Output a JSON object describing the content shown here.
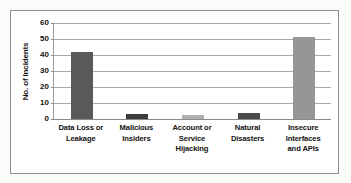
{
  "chart_data": {
    "type": "bar",
    "title": "",
    "subtitle": "",
    "xlabel": "",
    "ylabel": "No. of Incidents",
    "categories": [
      "Data Loss or Leakage",
      "Malicious Insiders",
      "Account or Service Hijacking",
      "Natural Disasters",
      "Insecure Interfaces and APIs"
    ],
    "category_lines": [
      [
        "Data Loss or",
        "Leakage"
      ],
      [
        "Malicious",
        "Insiders"
      ],
      [
        "Account or",
        "Service",
        "Hijacking"
      ],
      [
        "Natural",
        "Disasters"
      ],
      [
        "Insecure",
        "Interfaces",
        "and APIs"
      ]
    ],
    "values": [
      42,
      3,
      2.5,
      4,
      51
    ],
    "bar_colors": [
      "#595959",
      "#3b3b3b",
      "#b0b0b0",
      "#4a4a4a",
      "#969696"
    ],
    "ylim": [
      0,
      60
    ],
    "ytick_values": [
      0,
      10,
      20,
      30,
      40,
      50,
      60
    ],
    "ytick_labels": [
      "0",
      "10",
      "20",
      "30",
      "40",
      "50",
      "60"
    ],
    "grid": true,
    "grid_orientation": "horizontal",
    "legend": false,
    "legend_position": "none",
    "annotations": []
  },
  "figure": {
    "border_color": "#8d8d8d",
    "plot_background": "#ffffff",
    "gridline_color": "#a8a8a8",
    "axis_color": "#8a8a8a",
    "text_color": "#121212"
  }
}
